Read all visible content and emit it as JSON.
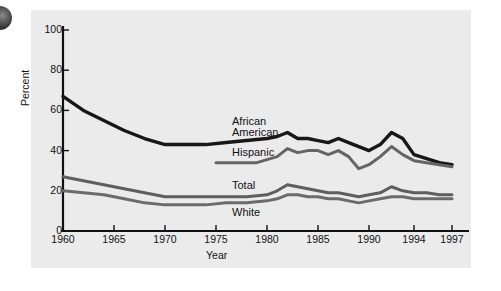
{
  "figure": {
    "background": "#ebebeb",
    "page_background": "#ffffff",
    "corner_icon": "dark-circle-bullet"
  },
  "chart_data": {
    "type": "line",
    "title": "",
    "xlabel": "Year",
    "ylabel": "Percent",
    "xlim": [
      1960,
      1997
    ],
    "ylim": [
      0,
      100
    ],
    "yticks": [
      0,
      20,
      40,
      60,
      80,
      100
    ],
    "xticks": [
      1960,
      1965,
      1970,
      1975,
      1980,
      1985,
      1990,
      1994,
      1997
    ],
    "grid": false,
    "legend": "inline-labels",
    "series": [
      {
        "name": "African American",
        "color": "#171717",
        "width": 3.4,
        "x": [
          1960,
          1962,
          1964,
          1966,
          1968,
          1970,
          1972,
          1974,
          1976,
          1978,
          1980,
          1981,
          1982,
          1983,
          1984,
          1985,
          1986,
          1987,
          1988,
          1989,
          1990,
          1991,
          1992,
          1993,
          1994,
          1995,
          1996,
          1997
        ],
        "y": [
          67,
          60,
          55,
          50,
          46,
          43,
          43,
          43,
          44,
          45,
          46,
          47,
          49,
          46,
          46,
          45,
          44,
          46,
          44,
          42,
          40,
          43,
          49,
          46,
          38,
          36,
          34,
          33
        ]
      },
      {
        "name": "Hispanic",
        "color": "#646464",
        "width": 3.0,
        "x": [
          1975,
          1977,
          1979,
          1981,
          1982,
          1983,
          1984,
          1985,
          1986,
          1987,
          1988,
          1989,
          1990,
          1991,
          1992,
          1993,
          1994,
          1995,
          1996,
          1997
        ],
        "y": [
          34,
          34,
          34,
          37,
          41,
          39,
          40,
          40,
          38,
          40,
          37,
          31,
          33,
          37,
          42,
          38,
          35,
          34,
          33,
          32
        ]
      },
      {
        "name": "Total",
        "color": "#5e5e5e",
        "width": 3.0,
        "x": [
          1960,
          1962,
          1964,
          1966,
          1968,
          1970,
          1972,
          1974,
          1976,
          1978,
          1980,
          1981,
          1982,
          1983,
          1984,
          1985,
          1986,
          1987,
          1988,
          1989,
          1990,
          1991,
          1992,
          1993,
          1994,
          1995,
          1996,
          1997
        ],
        "y": [
          27,
          25,
          23,
          21,
          19,
          17,
          17,
          17,
          17,
          17,
          18,
          20,
          23,
          22,
          21,
          20,
          19,
          19,
          18,
          17,
          18,
          19,
          22,
          20,
          19,
          19,
          18,
          18
        ]
      },
      {
        "name": "White",
        "color": "#6b6b6b",
        "width": 3.0,
        "x": [
          1960,
          1962,
          1964,
          1966,
          1968,
          1970,
          1972,
          1974,
          1976,
          1978,
          1980,
          1981,
          1982,
          1983,
          1984,
          1985,
          1986,
          1987,
          1988,
          1989,
          1990,
          1991,
          1992,
          1993,
          1994,
          1995,
          1996,
          1997
        ],
        "y": [
          20,
          19,
          18,
          16,
          14,
          13,
          13,
          13,
          14,
          14,
          15,
          16,
          18,
          18,
          17,
          17,
          16,
          16,
          15,
          14,
          15,
          16,
          17,
          17,
          16,
          16,
          16,
          16
        ]
      }
    ],
    "annotations": [
      {
        "text": "African",
        "x_px": 232,
        "y_px": 116
      },
      {
        "text": "American",
        "x_px": 232,
        "y_px": 127
      },
      {
        "text": "Hispanic",
        "x_px": 232,
        "y_px": 147
      },
      {
        "text": "Total",
        "x_px": 232,
        "y_px": 180
      },
      {
        "text": "White",
        "x_px": 232,
        "y_px": 207
      }
    ]
  }
}
